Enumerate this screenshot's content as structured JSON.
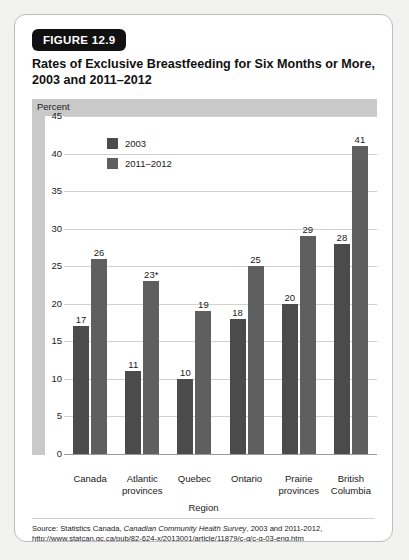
{
  "figure": {
    "badge": "FIGURE 12.9",
    "title": "Rates of Exclusive Breastfeeding for Six Months or More, 2003 and 2011–2012",
    "source_prefix": "Source: Statistics Canada, ",
    "source_italic": "Canadian Community Health Survey",
    "source_suffix": ", 2003 and 2011-2012,",
    "source_url": "http://www.statcan.gc.ca/pub/82-624-x/2013001/article/11879/c-g/c-g-03-eng.htm"
  },
  "chart_data": {
    "type": "bar",
    "title": "Rates of Exclusive Breastfeeding for Six Months or More, 2003 and 2011–2012",
    "xlabel": "Region",
    "ylabel": "Percent",
    "ylim": [
      0,
      45
    ],
    "yticks": [
      0,
      5,
      10,
      15,
      20,
      25,
      30,
      35,
      40,
      45
    ],
    "grid": true,
    "legend_position": "top-left",
    "categories": [
      "Canada",
      "Atlantic provinces",
      "Quebec",
      "Ontario",
      "Prairie provinces",
      "British Columbia"
    ],
    "category_lines": [
      [
        "Canada"
      ],
      [
        "Atlantic",
        "provinces"
      ],
      [
        "Quebec"
      ],
      [
        "Ontario"
      ],
      [
        "Prairie",
        "provinces"
      ],
      [
        "British",
        "Columbia"
      ]
    ],
    "series": [
      {
        "name": "2003",
        "color": "#4b4b4b",
        "values": [
          17,
          11,
          10,
          18,
          20,
          28
        ],
        "labels": [
          "17",
          "11",
          "10",
          "18",
          "20",
          "28"
        ]
      },
      {
        "name": "2011–2012",
        "color": "#5f5f5f",
        "values": [
          26,
          23,
          19,
          25,
          29,
          41
        ],
        "labels": [
          "26",
          "23*",
          "19",
          "25",
          "29",
          "41"
        ]
      }
    ]
  }
}
